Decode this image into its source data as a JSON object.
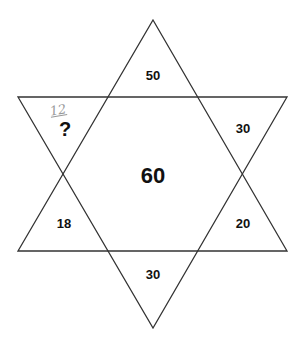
{
  "diagram": {
    "type": "six-pointed star number puzzle",
    "center": "60",
    "points": {
      "top": "50",
      "upper_right": "30",
      "lower_right": "20",
      "bottom": "30",
      "lower_left": "18",
      "upper_left": "?"
    },
    "handwritten_answer": "12",
    "line_color": "#333333"
  }
}
